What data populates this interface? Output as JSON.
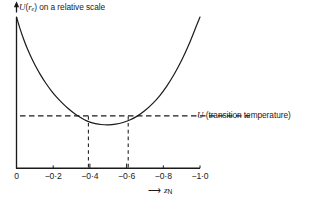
{
  "figure": {
    "background_color": "#ffffff",
    "ink_color": "#1a1a1a",
    "axis": {
      "y_label_prefix": "U",
      "y_label_paren_open": "(",
      "y_label_r": "r",
      "y_label_sub": "e",
      "y_label_paren_close": ")",
      "y_label_rest": " on a relative scale",
      "y_arrow_icon": "up-arrow-icon",
      "x_arrow_icon": "right-arrow-icon",
      "x_label_symbol": "z",
      "x_label_sub": "N"
    },
    "annotation": {
      "symbol": "U",
      "text": " (transition temperature)"
    }
  },
  "chart_data": {
    "type": "line",
    "title": "",
    "xlabel": "z_N",
    "ylabel": "U (r_e) on a relative scale",
    "xlim": [
      0,
      -1.0
    ],
    "ylim": [
      0,
      1.0
    ],
    "grid": false,
    "legend": "none",
    "x_ticks": [
      0,
      -0.2,
      -0.4,
      -0.6,
      -0.8,
      -1.0
    ],
    "x_tick_labels": [
      "0",
      "−0·2",
      "−0·4",
      "−0·6",
      "−0·8",
      "−1·0"
    ],
    "y_ticks": [],
    "y_tick_labels": [],
    "series": [
      {
        "name": "U(r_e) potential curve",
        "style": "solid",
        "x": [
          0.0,
          -0.02,
          -0.04,
          -0.06,
          -0.08,
          -0.1,
          -0.13,
          -0.16,
          -0.19,
          -0.22,
          -0.25,
          -0.28,
          -0.31,
          -0.34,
          -0.37,
          -0.4,
          -0.43,
          -0.46,
          -0.5,
          -0.54,
          -0.58,
          -0.62,
          -0.66,
          -0.7,
          -0.74,
          -0.78,
          -0.82,
          -0.86,
          -0.9,
          -0.94,
          -0.98,
          -1.0
        ],
        "y": [
          1.0,
          0.92,
          0.85,
          0.788,
          0.733,
          0.684,
          0.619,
          0.562,
          0.512,
          0.468,
          0.43,
          0.396,
          0.367,
          0.342,
          0.321,
          0.305,
          0.295,
          0.289,
          0.287,
          0.291,
          0.302,
          0.32,
          0.346,
          0.381,
          0.425,
          0.479,
          0.545,
          0.623,
          0.714,
          0.82,
          0.94,
          1.0
        ]
      }
    ],
    "reference_lines": [
      {
        "name": "transition-temperature-level",
        "orientation": "horizontal",
        "style": "dashed",
        "y": 0.305,
        "x_from": 0.0,
        "x_to": -1.3,
        "label": "U (transition temperature)"
      },
      {
        "name": "intersection-marker-left",
        "orientation": "vertical",
        "style": "dashed",
        "x": -0.4,
        "y_from": 0.0,
        "y_to": 0.305
      },
      {
        "name": "intersection-marker-right",
        "orientation": "vertical",
        "style": "dashed",
        "x": -0.6,
        "y_from": 0.0,
        "y_to": 0.305
      }
    ],
    "intersections": [
      -0.4,
      -0.6
    ]
  }
}
